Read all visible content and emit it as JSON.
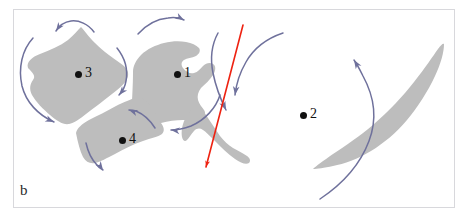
{
  "figure": {
    "panel_letter": "b",
    "background_color": "#ffffff",
    "frame_color": "#d8d8dc",
    "shape_fill_color": "#bdbdbd",
    "arrow_color": "#6f719c",
    "fault_line_color": "#ee2211",
    "label_color": "#111111"
  },
  "points": [
    {
      "id": "point-1",
      "label": "1",
      "dot_x": 174,
      "dot_y": 71,
      "label_x": 184,
      "label_y": 66
    },
    {
      "id": "point-2",
      "label": "2",
      "dot_x": 300,
      "dot_y": 112,
      "label_x": 310,
      "label_y": 107
    },
    {
      "id": "point-3",
      "label": "3",
      "dot_x": 75,
      "dot_y": 71,
      "label_x": 85,
      "label_y": 66
    },
    {
      "id": "point-4",
      "label": "4",
      "dot_x": 119,
      "dot_y": 137,
      "label_x": 129,
      "label_y": 132
    }
  ],
  "blocks": [
    {
      "id": "block-3",
      "name": "crustal-block-3",
      "path": "M 28 68 C 26 62 32 57 40 54 C 50 50 60 46 68 40 C 74 35 78 30 81 27 C 84 30 88 36 95 43 C 104 52 113 58 120 63 C 126 67 129 71 128 76 C 127 82 120 88 112 94 C 103 101 94 108 86 114 C 80 119 74 123 69 124 C 63 125 57 121 50 115 C 43 109 36 102 32 95 C 29 89 30 84 33 80 C 36 76 33 73 28 68 Z"
    },
    {
      "id": "block-1",
      "name": "crustal-block-1",
      "path": "M 133 72 C 133 66 136 60 141 55 C 147 49 156 45 164 43 C 172 41 180 41 186 42 C 192 43 196 45 199 48 C 201 51 199 54 196 56 C 192 58 187 58 184 60 C 181 62 181 65 183 68 C 186 72 190 74 194 73 C 198 72 200 69 203 66 C 206 63 210 62 213 64 C 216 66 216 70 213 75 C 210 80 205 84 201 88 C 198 92 197 96 198 100 C 199 104 202 107 204 110 C 206 113 205 116 201 118 C 196 120 190 120 183 120 C 176 120 168 121 161 123 C 154 125 148 128 143 130 C 139 131 136 130 134 126 C 132 121 132 114 132 106 C 132 97 133 86 133 72 Z"
    },
    {
      "id": "block-1-tail",
      "name": "crustal-block-1-tail",
      "path": "M 199 104 C 201 107 204 112 208 118 C 212 124 216 130 220 136 C 224 141 228 145 233 148 C 238 151 243 153 247 156 C 250 158 251 161 249 163 C 246 165 241 163 235 159 C 228 154 221 147 215 141 C 210 136 206 132 203 130 C 200 128 197 128 194 131 C 191 134 189 138 187 140 C 185 142 183 141 182 137 C 181 132 182 125 185 119 C 188 113 193 108 199 104 Z"
    },
    {
      "id": "block-4",
      "name": "crustal-block-4",
      "path": "M 76 133 C 77 128 82 124 89 120 C 97 116 107 111 116 106 C 124 102 131 99 136 98 C 141 97 145 99 149 104 C 153 110 157 117 161 123 C 164 127 165 131 162 134 C 158 137 151 138 143 141 C 134 144 124 149 115 154 C 107 158 100 162 95 163 C 90 164 86 162 83 157 C 80 151 78 143 76 133 Z"
    },
    {
      "id": "block-2-wedge",
      "name": "crustal-block-2-wedge",
      "path": "M 444 44 C 444 52 441 63 435 76 C 428 91 418 107 407 120 C 396 133 384 143 371 151 C 358 159 344 164 333 166 C 324 168 317 169 313 169 C 316 166 323 161 333 154 C 345 146 360 136 374 124 C 389 111 403 96 414 82 C 425 68 433 56 438 49 C 441 45 443 43 444 44 Z"
    }
  ],
  "arrows": [
    {
      "id": "arrow-top-left",
      "name": "rotation-arrow-block-3-top",
      "path": "M 94 32 C 88 24 79 20 71 21 C 64 22 59 26 56 31",
      "head_x": 56,
      "head_y": 31,
      "head_angle": 125
    },
    {
      "id": "arrow-left-outer",
      "name": "rotation-arrow-block-3-left",
      "path": "M 33 38 C 22 50 18 68 22 86 C 26 102 38 115 54 122",
      "head_x": 54,
      "head_y": 122,
      "head_angle": 24
    },
    {
      "id": "arrow-block3-right",
      "name": "rotation-arrow-block-3-right",
      "path": "M 117 48 C 125 58 128 70 126 81 C 125 87 122 92 119 95",
      "head_x": 119,
      "head_y": 95,
      "head_angle": 130
    },
    {
      "id": "arrow-top-middle",
      "name": "rotation-arrow-block-1-top",
      "path": "M 138 34 C 146 25 157 19 168 18 C 175 17 180 18 184 20",
      "head_x": 184,
      "head_y": 20,
      "head_angle": 28
    },
    {
      "id": "arrow-block1-bottom",
      "name": "transport-arrow-block-1-bottom",
      "path": "M 220 95 C 216 108 205 120 191 126 C 183 129 176 130 171 130",
      "head_x": 171,
      "head_y": 130,
      "head_angle": 186
    },
    {
      "id": "arrow-block4-inner",
      "name": "rotation-arrow-block-4-inner",
      "path": "M 155 128 C 150 120 143 114 136 111 C 133 110 131 110 129 110",
      "head_x": 129,
      "head_y": 110,
      "head_angle": 200
    },
    {
      "id": "arrow-block4-bottom",
      "name": "rotation-arrow-block-4-bottom",
      "path": "M 86 143 C 88 152 92 160 97 165 C 99 168 101 169 103 170",
      "head_x": 103,
      "head_y": 170,
      "head_angle": 55
    },
    {
      "id": "arrow-center-down",
      "name": "transport-arrow-center-down",
      "path": "M 218 33 C 212 44 210 58 213 73 C 216 88 221 100 226 110",
      "head_x": 226,
      "head_y": 110,
      "head_angle": 65
    },
    {
      "id": "arrow-center-right",
      "name": "rotation-arrow-center-right",
      "path": "M 283 33 C 268 38 254 48 246 62 C 239 74 236 86 235 95",
      "head_x": 235,
      "head_y": 95,
      "head_angle": 98
    },
    {
      "id": "arrow-block2-right",
      "name": "rotation-arrow-block-2-right",
      "path": "M 320 199 C 341 185 360 165 369 141 C 377 120 375 98 363 76 C 360 70 357 64 354 60",
      "head_x": 354,
      "head_y": 60,
      "head_angle": 238
    }
  ],
  "fault_line": {
    "id": "fault-line",
    "name": "fault-line-red",
    "path": "M 243 25 L 206 167",
    "head_x": 206,
    "head_y": 167,
    "head_angle": 105
  }
}
